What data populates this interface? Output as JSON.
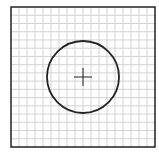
{
  "diagram": {
    "type": "grid-with-circle",
    "grid": {
      "x": 11,
      "y": 7,
      "width": 144,
      "height": 140,
      "columns": 18,
      "rows": 17,
      "line_color": "#c8c8c8",
      "border_color": "#222222"
    },
    "circle": {
      "cx": 83,
      "cy": 77,
      "r": 36,
      "stroke_color": "#222222"
    },
    "crosshair": {
      "cx": 83,
      "cy": 77,
      "half_length": 9,
      "stroke_color": "#222222"
    }
  }
}
